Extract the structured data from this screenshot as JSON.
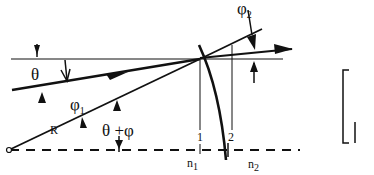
{
  "diagram": {
    "labels": {
      "theta": "θ",
      "phi1": "φ",
      "phi1_sub": "1",
      "phi2": "φ",
      "phi2_sub": "2",
      "theta_plus_phi": "θ +φ",
      "radius": "R",
      "plane1": "1",
      "plane2": "2",
      "n1": "n",
      "n1_sub": "1",
      "n2": "n",
      "n2_sub": "2"
    },
    "colors": {
      "ink": "#111111",
      "background": "#ffffff"
    }
  }
}
